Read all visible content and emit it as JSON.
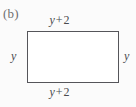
{
  "figure": {
    "part_label": "(b)",
    "shape": "rectangle",
    "labels": {
      "top": {
        "var": "y",
        "op": "+",
        "num": "2",
        "full": "y + 2"
      },
      "bottom": {
        "var": "y",
        "op": "+",
        "num": "2",
        "full": "y + 2"
      },
      "left": {
        "full": "y"
      },
      "right": {
        "full": "y"
      }
    },
    "colors": {
      "page_background": "#fbfbfb",
      "shape_fill": "#ffffff",
      "shape_stroke": "#55555a",
      "label_text": "#4a4a4e",
      "part_label_text": "#6e6e70"
    }
  }
}
